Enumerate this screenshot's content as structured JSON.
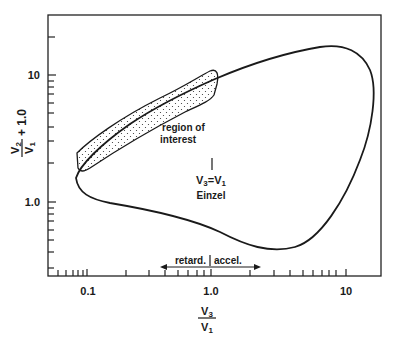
{
  "diagram": {
    "type": "log-log operating diagram",
    "x_axis": {
      "label_numerator": "V",
      "label_numerator_sub": "3",
      "label_denominator": "V",
      "label_denominator_sub": "1",
      "scale": "log",
      "tick_labels": [
        "0.1",
        "1.0",
        "10"
      ],
      "range": [
        0.05,
        15
      ]
    },
    "y_axis": {
      "label_numerator": "V",
      "label_numerator_sub": "2",
      "label_denominator": "V",
      "label_denominator_sub": "1",
      "label_suffix": "+ 1.0",
      "scale": "log",
      "tick_labels": [
        "10",
        "1.0"
      ],
      "range": [
        0.16,
        30
      ]
    },
    "annotations": {
      "region_line1": "region of",
      "region_line2": "interest",
      "einzel_eq_main": "V",
      "einzel_eq_sub1": "3",
      "einzel_eq_mid": "=V",
      "einzel_eq_sub2": "1",
      "einzel_label": "Einzel",
      "retard_label": "retard.",
      "accel_label": "accel."
    },
    "colors": {
      "line": "#1a1a1a",
      "background": "#ffffff",
      "stipple": "#333333"
    }
  }
}
